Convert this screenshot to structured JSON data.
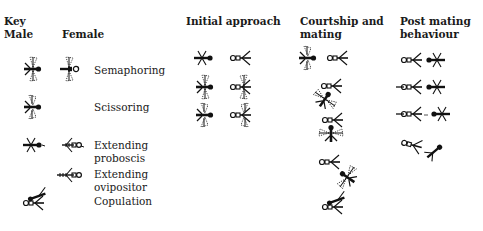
{
  "key": {
    "title": "Key",
    "male_label": "Male",
    "female_label": "Female",
    "rows": [
      {
        "label": "Semaphoring",
        "male_icon": "male-semaphoring-icon",
        "female_icon": "female-semaphoring-icon"
      },
      {
        "label": "Scissoring",
        "male_icon": "male-scissoring-icon",
        "female_icon": null
      },
      {
        "label_line1": "Extending",
        "label_line2": "proboscis",
        "male_icon": "male-proboscis-icon",
        "female_icon": "female-proboscis-icon"
      },
      {
        "label_line1": "Extending",
        "label_line2": "ovipositor",
        "male_icon": null,
        "female_icon": "female-ovipositor-icon"
      },
      {
        "label": "Copulation",
        "male_icon": "copulation-pair-icon",
        "female_icon": null
      }
    ]
  },
  "columns": {
    "initial_approach": {
      "title": "Initial approach",
      "icons": [
        "male-plain",
        "female-plain",
        "male-semaphoring",
        "female-semaphoring",
        "male-scissoring",
        "female-scissoring"
      ]
    },
    "courtship": {
      "title_line1": "Courtship and",
      "title_line2": "mating",
      "icons": [
        "male-scissoring",
        "female-plain",
        "female-plus-male-tilted-semaphoring",
        "female-plus-male-vertical-semaphoring",
        "female-plus-male-angled-semaphoring",
        "copulation-pair"
      ]
    },
    "post_mating": {
      "title_line1": "Post mating",
      "title_line2": "behaviour",
      "icons": [
        "pair-adjacent",
        "pair-aligned-proboscis",
        "pair-separated-dotted",
        "pair-departing"
      ]
    }
  },
  "colors": {
    "ink": "#111111",
    "background": "#ffffff"
  }
}
